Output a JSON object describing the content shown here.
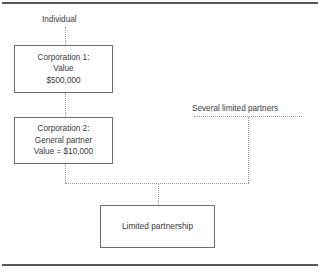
{
  "diagram": {
    "frame": {
      "top_rule": "top-divider",
      "bottom_rule": "bottom-divider"
    },
    "labels": {
      "individual": "Individual",
      "several_limited_partners": "Several limited partners"
    },
    "nodes": {
      "corporation1": {
        "name": "corporation-1",
        "lines": [
          "Corporation 1:",
          "Value",
          "$500,000"
        ]
      },
      "corporation2": {
        "name": "corporation-2",
        "lines": [
          "Corporation 2:",
          "General partner",
          "Value = $10,000"
        ]
      },
      "limited_partnership": {
        "name": "limited-partnership",
        "lines": [
          "Limited partnership"
        ]
      }
    },
    "connectors": [
      {
        "name": "individual-to-corporation-1",
        "style": "dotted",
        "orientation": "vertical"
      },
      {
        "name": "corporation-1-to-corporation-2",
        "style": "dotted",
        "orientation": "vertical"
      },
      {
        "name": "corporation-2-to-bus",
        "style": "dotted",
        "orientation": "vertical"
      },
      {
        "name": "horizontal-bus",
        "style": "dotted",
        "orientation": "horizontal"
      },
      {
        "name": "several-limited-partners-bar",
        "style": "dotted",
        "orientation": "horizontal"
      },
      {
        "name": "several-limited-partners-to-bus",
        "style": "dotted",
        "orientation": "vertical"
      },
      {
        "name": "bus-to-limited-partnership",
        "style": "dotted",
        "orientation": "vertical"
      }
    ],
    "colors": {
      "rule": "#58585a",
      "box_border": "#6e6e70",
      "text": "#3a3a3c",
      "connector": "#9a9a9c",
      "background": "#ffffff"
    }
  }
}
